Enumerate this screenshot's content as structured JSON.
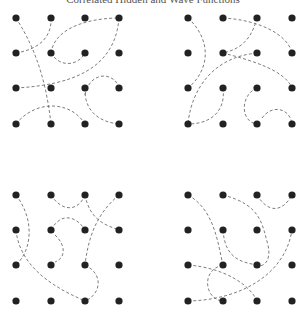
{
  "title": "Correlated Hidden and Wave Functions",
  "colors": {
    "dot": "#222222",
    "curve": "#6e6e6e",
    "background": "#ffffff"
  },
  "panels": [
    {
      "id": "top-left",
      "grid": {
        "cols": [
          16,
          51,
          85,
          119
        ],
        "rows": [
          18,
          53,
          88,
          124
        ]
      },
      "curves": [
        "M16,18 C30,40 45,70 51,124",
        "M51,18 C52,40 35,50 16,53",
        "M51,53 C55,25 95,18 119,18",
        "M119,18 C115,70 70,85 16,88",
        "M51,53 C60,68 78,66 85,53",
        "M85,88 C84,112 100,122 119,124",
        "M85,95 C90,70 115,72 119,88",
        "M16,124 C35,100 70,100 85,124"
      ]
    },
    {
      "id": "top-right",
      "grid": {
        "cols": [
          188,
          223,
          257,
          292
        ],
        "rows": [
          18,
          53,
          88,
          124
        ]
      },
      "curves": [
        "M188,18 C212,40 210,70 188,88",
        "M223,18 C260,20 288,35 292,53",
        "M257,18 C250,45 235,50 223,53",
        "M223,53 C250,60 285,70 292,88",
        "M257,53 C205,58 190,100 188,124",
        "M223,88 C226,112 210,124 188,124",
        "M257,88 C240,95 240,122 257,124",
        "M262,118 C272,104 290,108 292,124"
      ]
    },
    {
      "id": "bottom-left",
      "grid": {
        "cols": [
          16,
          51,
          85,
          119
        ],
        "rows": [
          195,
          230,
          265,
          301
        ]
      },
      "curves": [
        "M16,195 C35,220 32,250 16,265",
        "M51,195 C62,212 78,212 85,195",
        "M85,195 C90,220 105,225 119,230",
        "M119,195 C95,215 88,240 85,265",
        "M51,230 C62,210 78,218 85,230",
        "M55,235 C66,245 66,258 55,262",
        "M16,230 C20,270 60,290 85,301",
        "M85,265 C105,275 100,295 85,301"
      ]
    },
    {
      "id": "bottom-right",
      "grid": {
        "cols": [
          188,
          223,
          257,
          292
        ],
        "rows": [
          195,
          230,
          265,
          301
        ]
      },
      "curves": [
        "M188,195 C215,210 218,245 223,265",
        "M223,195 C262,205 262,225 268,245 C272,262 262,268 257,265",
        "M257,195 C268,213 282,213 292,195",
        "M223,230 C225,258 240,262 257,265",
        "M188,265 C225,268 250,285 257,301",
        "M223,265 C200,270 205,300 223,301",
        "M188,301 C240,300 285,275 292,230"
      ]
    }
  ]
}
